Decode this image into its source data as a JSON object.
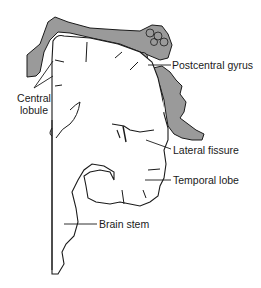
{
  "figure": {
    "type": "anatomical-diagram",
    "colors": {
      "outline": "#1a1a1a",
      "shaded": "#9a9a9a",
      "background": "#ffffff"
    }
  },
  "labels": {
    "postcentral_gyrus": "Postcentral gyrus",
    "central_lobule_line1": "Central",
    "central_lobule_line2": "lobule",
    "lateral_fissure": "Lateral fissure",
    "temporal_lobe": "Temporal lobe",
    "brain_stem": "Brain stem"
  }
}
